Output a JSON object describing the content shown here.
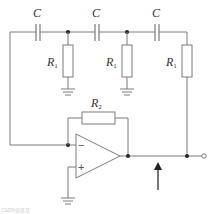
{
  "diagram": {
    "type": "RC phase-shift oscillator circuit",
    "capacitors": [
      {
        "label": "C",
        "x": 38
      },
      {
        "label": "C",
        "x": 97
      },
      {
        "label": "C",
        "x": 157
      }
    ],
    "shunt_resistors": [
      {
        "label": "R",
        "subscript": "1",
        "x": 68
      },
      {
        "label": "R",
        "subscript": "1",
        "x": 127
      },
      {
        "label": "R",
        "subscript": "1",
        "x": 187
      }
    ],
    "feedback_resistor": {
      "label": "R",
      "subscript": "2"
    },
    "opamp": {
      "inverting_sign": "−",
      "noninverting_sign": "+"
    },
    "output_arrow": "up-arrow",
    "footer_text": "CSDN@某某"
  },
  "colors": {
    "wire": "#7a7a7a",
    "node": "#222222",
    "label": "#333333",
    "background": "#ffffff"
  }
}
